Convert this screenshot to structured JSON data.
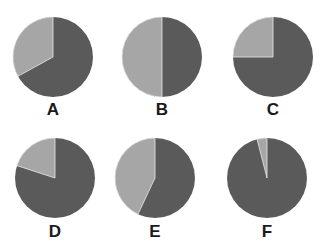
{
  "chart_data": {
    "type": "pie",
    "title": "",
    "colors": {
      "dark": "#5a5a5a",
      "light": "#a6a6a6",
      "separator": "#e8e8e8"
    },
    "grid": false,
    "legend": "none",
    "charts": [
      {
        "label": "A",
        "series": [
          {
            "name": "light",
            "value": 33
          },
          {
            "name": "dark",
            "value": 67
          }
        ]
      },
      {
        "label": "B",
        "series": [
          {
            "name": "light",
            "value": 50
          },
          {
            "name": "dark",
            "value": 50
          }
        ]
      },
      {
        "label": "C",
        "series": [
          {
            "name": "light",
            "value": 25
          },
          {
            "name": "dark",
            "value": 75
          }
        ]
      },
      {
        "label": "D",
        "series": [
          {
            "name": "light",
            "value": 20
          },
          {
            "name": "dark",
            "value": 80
          }
        ]
      },
      {
        "label": "E",
        "series": [
          {
            "name": "light",
            "value": 43
          },
          {
            "name": "dark",
            "value": 57
          }
        ]
      },
      {
        "label": "F",
        "series": [
          {
            "name": "light",
            "value": 4
          },
          {
            "name": "dark",
            "value": 96
          }
        ]
      }
    ]
  },
  "layout": {
    "positions": [
      {
        "cx": 53,
        "cy": 57,
        "ly": 100
      },
      {
        "cx": 162,
        "cy": 57,
        "ly": 100
      },
      {
        "cx": 273,
        "cy": 57,
        "ly": 100
      },
      {
        "cx": 55,
        "cy": 178,
        "ly": 222
      },
      {
        "cx": 155,
        "cy": 178,
        "ly": 222
      },
      {
        "cx": 267,
        "cy": 178,
        "ly": 222
      }
    ],
    "radius": 40
  }
}
